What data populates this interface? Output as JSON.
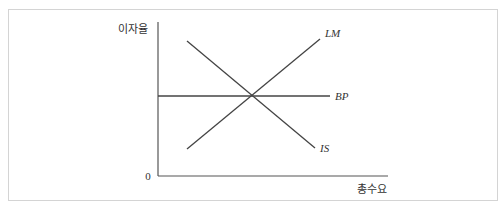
{
  "diagram": {
    "type": "IS-LM-BP",
    "y_axis_label": "이자율",
    "x_axis_label": "총수요",
    "origin_label": "0",
    "curves": [
      {
        "name": "LM",
        "label": "LM",
        "slope": "upward"
      },
      {
        "name": "IS",
        "label": "IS",
        "slope": "downward"
      },
      {
        "name": "BP",
        "label": "BP",
        "slope": "horizontal"
      }
    ]
  },
  "colors": {
    "line": "#444444",
    "axis": "#555555",
    "border": "#d4d4d4"
  }
}
